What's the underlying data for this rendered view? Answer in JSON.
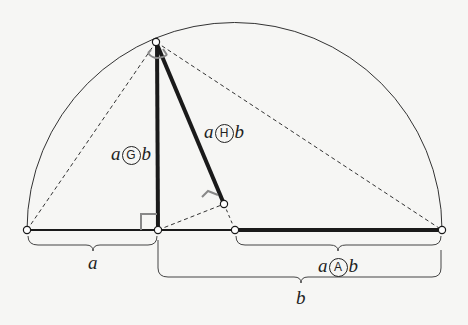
{
  "diagram": {
    "labels": {
      "segment_a": "a",
      "segment_b": "b",
      "geometric_mean": {
        "left": "a",
        "op": "G",
        "right": "b"
      },
      "harmonic_mean": {
        "left": "a",
        "op": "H",
        "right": "b"
      },
      "arithmetic_mean": {
        "left": "a",
        "op": "A",
        "right": "b"
      }
    },
    "points": {
      "left_end": [
        27,
        230
      ],
      "foot": [
        158,
        230
      ],
      "center": [
        235,
        230
      ],
      "right_end": [
        442,
        230
      ],
      "top": [
        156,
        42
      ],
      "harmonic_foot": [
        224,
        204
      ]
    },
    "colors": {
      "background": "#f6f6f4",
      "stroke": "#1a1a1a",
      "right_angle_marker": "#888888",
      "arc": "#333333"
    }
  }
}
